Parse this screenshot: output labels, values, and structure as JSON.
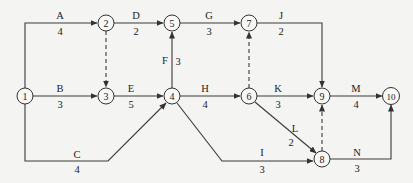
{
  "diagram": {
    "type": "activity-on-arrow network",
    "nodes": [
      {
        "id": "1",
        "x": 25,
        "y": 96
      },
      {
        "id": "2",
        "x": 106,
        "y": 23
      },
      {
        "id": "3",
        "x": 106,
        "y": 96
      },
      {
        "id": "4",
        "x": 172,
        "y": 96
      },
      {
        "id": "5",
        "x": 172,
        "y": 23
      },
      {
        "id": "6",
        "x": 249,
        "y": 96
      },
      {
        "id": "7",
        "x": 249,
        "y": 23
      },
      {
        "id": "8",
        "x": 322,
        "y": 159
      },
      {
        "id": "9",
        "x": 322,
        "y": 96
      },
      {
        "id": "10",
        "x": 391,
        "y": 96
      }
    ],
    "activities": [
      {
        "name": "A",
        "duration": "4",
        "from": "1",
        "to": "2"
      },
      {
        "name": "B",
        "duration": "3",
        "from": "1",
        "to": "3"
      },
      {
        "name": "C",
        "duration": "4",
        "from": "1",
        "to": "4"
      },
      {
        "name": "D",
        "duration": "2",
        "from": "2",
        "to": "5"
      },
      {
        "name": "E",
        "duration": "5",
        "from": "3",
        "to": "4"
      },
      {
        "name": "F",
        "duration": "3",
        "from": "4",
        "to": "5"
      },
      {
        "name": "G",
        "duration": "3",
        "from": "5",
        "to": "7"
      },
      {
        "name": "H",
        "duration": "4",
        "from": "4",
        "to": "6"
      },
      {
        "name": "I",
        "duration": "3",
        "from": "4",
        "to": "8"
      },
      {
        "name": "J",
        "duration": "2",
        "from": "7",
        "to": "9"
      },
      {
        "name": "K",
        "duration": "3",
        "from": "6",
        "to": "9"
      },
      {
        "name": "L",
        "duration": "2",
        "from": "6",
        "to": "8"
      },
      {
        "name": "M",
        "duration": "4",
        "from": "9",
        "to": "10"
      },
      {
        "name": "N",
        "duration": "3",
        "from": "8",
        "to": "10"
      }
    ],
    "dummies": [
      {
        "from": "2",
        "to": "3"
      },
      {
        "from": "6",
        "to": "7"
      },
      {
        "from": "8",
        "to": "9"
      }
    ]
  }
}
